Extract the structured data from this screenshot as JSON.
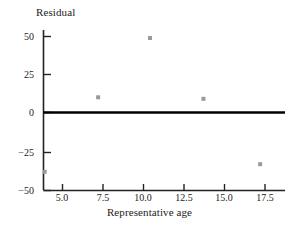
{
  "chart_data": {
    "type": "scatter",
    "title": "",
    "xlabel": "Representative age",
    "ylabel": "Residual",
    "xlim": [
      3.0,
      18.0
    ],
    "ylim": [
      -50,
      58
    ],
    "grid": false,
    "legend": "none",
    "xticks": [
      "5.0",
      "7.5",
      "10.0",
      "12.5",
      "15.0",
      "17.5"
    ],
    "xtick_values": [
      5.0,
      7.5,
      10.0,
      12.5,
      15.0,
      17.5
    ],
    "yticks": [
      "50",
      "25",
      "0",
      "−25",
      "−50"
    ],
    "ytick_values": [
      50,
      25,
      0,
      -25,
      -50
    ],
    "reference_line": {
      "orientation": "horizontal",
      "value": 0,
      "color": "#000000"
    },
    "marker": {
      "shape": "square",
      "color": "#9a9a9a",
      "size": 4
    },
    "points": [
      {
        "x": 3.9,
        "y": -39
      },
      {
        "x": 7.2,
        "y": 10
      },
      {
        "x": 10.4,
        "y": 49
      },
      {
        "x": 13.7,
        "y": 9
      },
      {
        "x": 17.2,
        "y": -34
      }
    ],
    "series": [
      {
        "name": "residuals",
        "x": [
          3.9,
          7.2,
          10.4,
          13.7,
          17.2
        ],
        "values": [
          -39,
          10,
          49,
          9,
          -34
        ]
      }
    ]
  },
  "axes": {
    "y_title": "Residual",
    "x_title": "Representative age",
    "y_tick_labels": [
      "50",
      "25",
      "0",
      "−25",
      "−50"
    ],
    "x_tick_labels": [
      "5.0",
      "7.5",
      "10.0",
      "12.5",
      "15.0",
      "17.5"
    ]
  },
  "colors": {
    "axis": "#222222",
    "marker": "#9a9a9a",
    "zero_line": "#000000",
    "text": "#1c1c1c",
    "background": "#ffffff"
  }
}
